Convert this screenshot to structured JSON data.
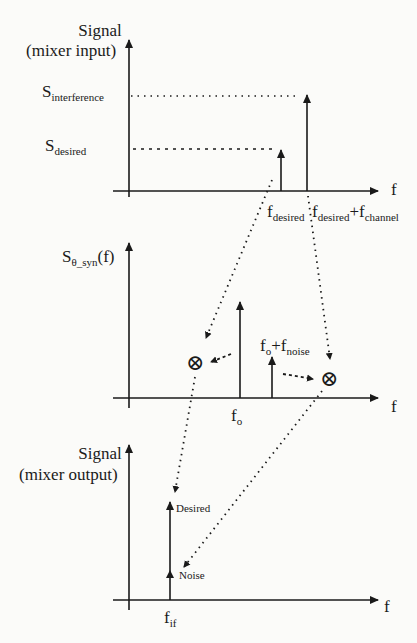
{
  "panels": {
    "input": {
      "ylabel_line1": "Signal",
      "ylabel_line2": "(mixer input)",
      "levels": {
        "interference": {
          "S": "S",
          "sub": "interference"
        },
        "desired": {
          "S": "S",
          "sub": "desired"
        }
      },
      "xlabel": "f",
      "ticks": {
        "desired": {
          "f": "f",
          "sub": "desired"
        },
        "interferer": {
          "f1": "f",
          "sub1": "desired",
          "plus": "+",
          "f2": "f",
          "sub2": "channel"
        }
      }
    },
    "lo": {
      "ylabel": {
        "S": "S",
        "sub": "θ_syn",
        "tail": "(f)"
      },
      "xlabel": "f",
      "ticks": {
        "fo": {
          "f": "f",
          "sub": "o"
        },
        "noise": {
          "f1": "f",
          "sub1": "o",
          "plus": "+",
          "f2": "f",
          "sub2": "noise"
        }
      },
      "mixer_symbol": "⊗"
    },
    "output": {
      "ylabel_line1": "Signal",
      "ylabel_line2": "(mixer output)",
      "xlabel": "f",
      "tick": {
        "f": "f",
        "sub": "if"
      },
      "annotations": {
        "desired": "Desired",
        "noise": "Noise"
      }
    }
  },
  "colors": {
    "ink": "#1a1a1a",
    "background": "#fbfbf9"
  }
}
